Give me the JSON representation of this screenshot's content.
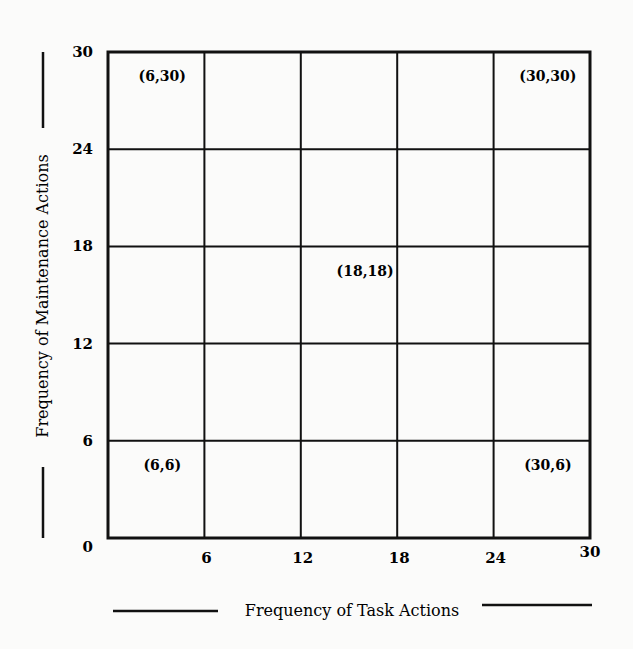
{
  "chart_data": {
    "type": "scatter",
    "title": "",
    "xlabel": "Frequency of Task Actions",
    "ylabel": "Frequency of Maintenance Actions",
    "xlim": [
      0,
      30
    ],
    "ylim": [
      0,
      30
    ],
    "x_ticks": [
      0,
      6,
      12,
      18,
      24,
      30
    ],
    "y_ticks": [
      0,
      6,
      12,
      18,
      24,
      30
    ],
    "x_tick_labels": [
      "6",
      "12",
      "18",
      "24",
      "30"
    ],
    "y_tick_labels": [
      "0",
      "6",
      "12",
      "18",
      "24",
      "30"
    ],
    "grid": true,
    "points": [
      {
        "x": 6,
        "y": 30,
        "label": "(6,30)"
      },
      {
        "x": 30,
        "y": 30,
        "label": "(30,30)"
      },
      {
        "x": 18,
        "y": 18,
        "label": "(18,18)"
      },
      {
        "x": 6,
        "y": 6,
        "label": "(6,6)"
      },
      {
        "x": 30,
        "y": 6,
        "label": "(30,6)"
      }
    ]
  },
  "colors": {
    "ink": "#111111",
    "paper": "#fbfbfa"
  }
}
